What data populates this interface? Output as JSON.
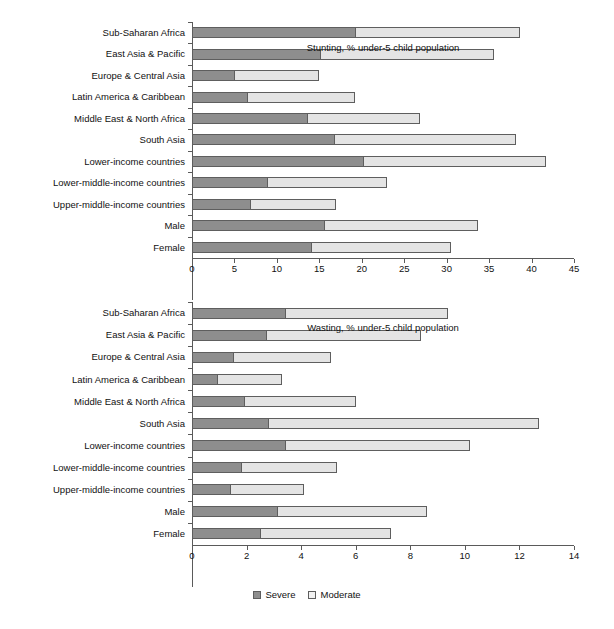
{
  "legend": {
    "items": [
      {
        "label": "Severe",
        "color": "#8e8e8e"
      },
      {
        "label": "Moderate",
        "color": "#e4e4e4"
      }
    ]
  },
  "colors": {
    "severe": "#8e8e8e",
    "moderate": "#e4e4e4",
    "axis": "#5a5a5a",
    "border": "#5e5e5e",
    "background": "#ffffff"
  },
  "chart_data": [
    {
      "id": "stunting",
      "type": "bar",
      "orientation": "horizontal",
      "stacked": true,
      "title": "",
      "xlabel": "Stunting, % under-5 child population",
      "ylabel": "",
      "xlim": [
        0,
        45
      ],
      "xticks": [
        0,
        5,
        10,
        15,
        20,
        25,
        30,
        35,
        40,
        45
      ],
      "grid": false,
      "legend_position": "bottom",
      "categories": [
        "Sub-Saharan Africa",
        "East Asia & Pacific",
        "Europe & Central Asia",
        "Latin America & Caribbean",
        "Middle East & North Africa",
        "South Asia",
        "Lower-income countries",
        "Lower-middle-income countries",
        "Upper-middle-income countries",
        "Male",
        "Female"
      ],
      "series": [
        {
          "name": "Severe",
          "values": [
            19.2,
            15.1,
            4.9,
            6.5,
            13.6,
            16.7,
            20.1,
            8.8,
            6.8,
            15.6,
            14.0
          ]
        },
        {
          "name": "Moderate",
          "values": [
            19.4,
            20.5,
            10.1,
            12.7,
            13.3,
            21.5,
            21.6,
            14.2,
            10.2,
            18.1,
            16.5
          ]
        }
      ],
      "totals": [
        38.6,
        35.6,
        15.0,
        19.2,
        26.9,
        38.2,
        41.7,
        23.0,
        17.0,
        33.7,
        30.5
      ]
    },
    {
      "id": "wasting",
      "type": "bar",
      "orientation": "horizontal",
      "stacked": true,
      "title": "",
      "xlabel": "Wasting, % under-5 child population",
      "ylabel": "",
      "xlim": [
        0,
        14
      ],
      "xticks": [
        0,
        2,
        4,
        6,
        8,
        10,
        12,
        14
      ],
      "grid": false,
      "legend_position": "bottom",
      "categories": [
        "Sub-Saharan Africa",
        "East Asia & Pacific",
        "Europe & Central Asia",
        "Latin America & Caribbean",
        "Middle East & North Africa",
        "South Asia",
        "Lower-income countries",
        "Lower-middle-income countries",
        "Upper-middle-income countries",
        "Male",
        "Female"
      ],
      "series": [
        {
          "name": "Severe",
          "values": [
            3.4,
            2.7,
            1.5,
            0.9,
            1.9,
            2.8,
            3.4,
            1.8,
            1.4,
            3.1,
            2.5
          ]
        },
        {
          "name": "Moderate",
          "values": [
            6.0,
            5.7,
            3.6,
            2.4,
            4.1,
            9.9,
            6.8,
            3.5,
            2.7,
            5.5,
            4.8
          ]
        }
      ],
      "totals": [
        9.4,
        8.4,
        5.1,
        3.3,
        6.0,
        12.7,
        10.2,
        5.3,
        4.1,
        8.6,
        7.3
      ]
    }
  ]
}
